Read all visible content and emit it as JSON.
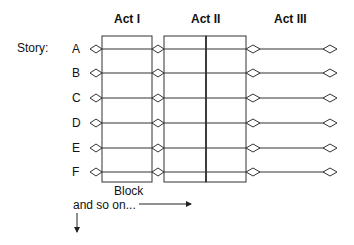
{
  "acts": [
    {
      "label": "Act I"
    },
    {
      "label": "Act II"
    },
    {
      "label": "Act III"
    }
  ],
  "story_label": "Story:",
  "rows": [
    {
      "label": "A"
    },
    {
      "label": "B"
    },
    {
      "label": "C"
    },
    {
      "label": "D"
    },
    {
      "label": "E"
    },
    {
      "label": "F"
    }
  ],
  "block_label": "Block",
  "continuation_label": "and so on..."
}
